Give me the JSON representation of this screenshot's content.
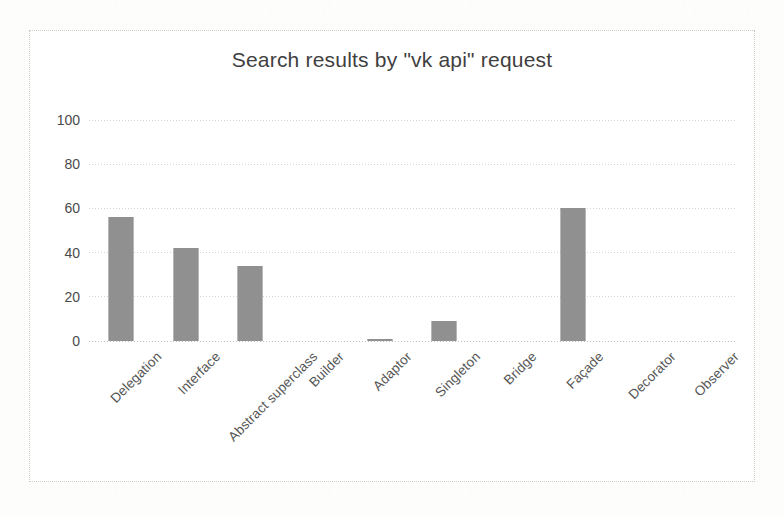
{
  "chart_data": {
    "type": "bar",
    "title": "Search results by \"vk api\" request",
    "xlabel": "",
    "ylabel": "",
    "ylim": [
      0,
      100
    ],
    "yticks": [
      0,
      20,
      40,
      60,
      80,
      100
    ],
    "grid": true,
    "legend": false,
    "bar_color": "#4d4d4d",
    "categories": [
      "Delegation",
      "Interface",
      "Abstract superclass",
      "Builder",
      "Adaptor",
      "Singleton",
      "Bridge",
      "Façade",
      "Decorator",
      "Observer"
    ],
    "values": [
      56,
      42,
      34,
      0,
      1,
      9,
      0,
      60,
      0,
      0
    ]
  }
}
